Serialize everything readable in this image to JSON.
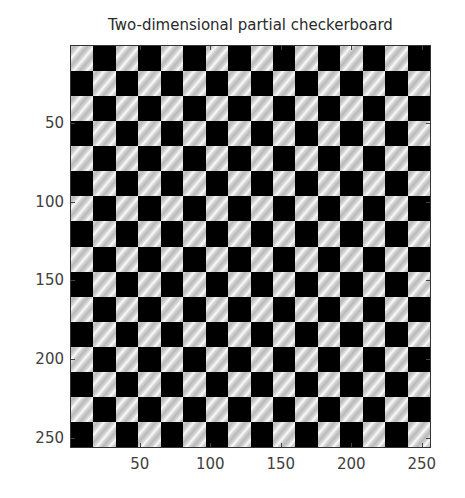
{
  "chart_data": {
    "type": "heatmap",
    "title": "Two-dimensional partial checkerboard",
    "xlabel": "",
    "ylabel": "",
    "xlim": [
      0.5,
      256.5
    ],
    "ylim": [
      0.5,
      256.5
    ],
    "y_axis_reversed": true,
    "grid": false,
    "legend": null,
    "x_ticks": [
      50,
      100,
      150,
      200,
      250
    ],
    "y_ticks": [
      50,
      100,
      150,
      200,
      250
    ],
    "x_tick_labels": [
      "50",
      "100",
      "150",
      "200",
      "250"
    ],
    "y_tick_labels": [
      "50",
      "100",
      "150",
      "200",
      "250"
    ],
    "grid_size": [
      16,
      16
    ],
    "cell_size_px": 16,
    "top_left_cell": "light",
    "light_cell_pattern": "diagonal sinusoidal stripes (gray/white)",
    "dark_cell_value": "black"
  },
  "colors": {
    "dark": "#000000",
    "light_base": "#b9b9b9",
    "light_highlight": "#fbfbfb",
    "axis": "#333333",
    "text": "#404040",
    "background": "#ffffff"
  }
}
